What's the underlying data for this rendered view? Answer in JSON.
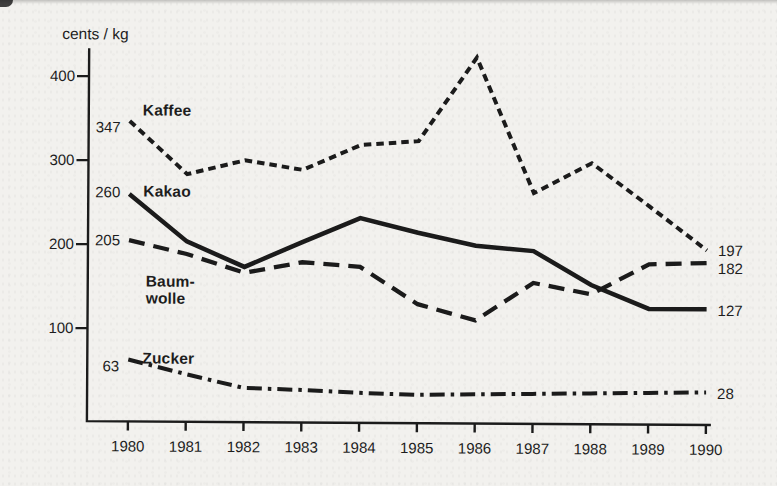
{
  "page": {
    "background": "#f2f1ee",
    "ink": "#1b1b1b"
  },
  "chart_data": {
    "type": "line",
    "title": "",
    "ylabel": "cents / kg",
    "xlabel": "",
    "categories": [
      1980,
      1981,
      1982,
      1983,
      1984,
      1985,
      1986,
      1987,
      1988,
      1989,
      1990
    ],
    "ylim": [
      0,
      440
    ],
    "yticks": [
      400,
      300,
      200,
      100
    ],
    "grid": false,
    "legend": "inline-labels-at-line-start",
    "series": [
      {
        "name": "Kaffee",
        "label_lines": [
          "Kaffee"
        ],
        "style": "dotted",
        "start_label": "347",
        "end_label": "197",
        "values": [
          347,
          284,
          301,
          290,
          320,
          325,
          425,
          264,
          300,
          249,
          197
        ]
      },
      {
        "name": "Kakao",
        "label_lines": [
          "Kakao"
        ],
        "style": "solid",
        "start_label": "260",
        "end_label": "127",
        "values": [
          260,
          204,
          174,
          204,
          233,
          216,
          201,
          195,
          155,
          127,
          127
        ]
      },
      {
        "name": "Baumwolle",
        "label_lines": [
          "Baum-",
          "wolle"
        ],
        "style": "long-dash",
        "start_label": "205",
        "end_label": "182",
        "values": [
          205,
          189,
          167,
          180,
          175,
          131,
          112,
          157,
          144,
          180,
          182
        ]
      },
      {
        "name": "Zucker",
        "label_lines": [
          "Zucker"
        ],
        "style": "dash-dot",
        "start_label": "63",
        "end_label": "28",
        "values": [
          63,
          46,
          30,
          28,
          25,
          23,
          24,
          25,
          26,
          27,
          28
        ]
      }
    ]
  }
}
